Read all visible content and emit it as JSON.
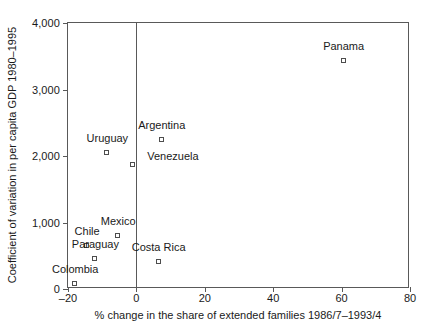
{
  "chart_data": {
    "type": "scatter",
    "title": "",
    "xlabel": "% change in the share of extended families 1986/7–1993/4",
    "ylabel": "Coefficient of variation in per capita GDP 1980–1995",
    "xlim": [
      -20,
      80
    ],
    "ylim": [
      0,
      4000
    ],
    "xticks": [
      -20,
      0,
      20,
      40,
      60,
      80
    ],
    "xtick_labels": [
      "–20",
      "0",
      "20",
      "40",
      "60",
      "80"
    ],
    "yticks": [
      0,
      1000,
      2000,
      3000,
      4000
    ],
    "ytick_labels": [
      "0",
      "1,000",
      "2,000",
      "3,000",
      "4,000"
    ],
    "grid": false,
    "legend": "none",
    "reference_lines": [
      {
        "name": "zero-vertical-line",
        "orientation": "vertical",
        "x": 0
      }
    ],
    "points": [
      {
        "label": "Panama",
        "x": 60.6,
        "y": 3430,
        "label_dx": 0,
        "label_dy": -9
      },
      {
        "label": "Argentina",
        "x": 7.4,
        "y": 2240,
        "label_dx": 0,
        "label_dy": -9
      },
      {
        "label": "Uruguay",
        "x": -8.5,
        "y": 2050,
        "label_dx": 0,
        "label_dy": -9
      },
      {
        "label": "Venezuela",
        "x": -1.0,
        "y": 1860,
        "label_dx": 40,
        "label_dy": -3
      },
      {
        "label": "Mexico",
        "x": -5.3,
        "y": 800,
        "label_dx": 0,
        "label_dy": -9
      },
      {
        "label": "Chile",
        "x": -14.4,
        "y": 650,
        "label_dx": 0,
        "label_dy": -9
      },
      {
        "label": "Paraguay",
        "x": -12.0,
        "y": 450,
        "label_dx": 0,
        "label_dy": -9
      },
      {
        "label": "Costa Rica",
        "x": 6.5,
        "y": 405,
        "label_dx": 0,
        "label_dy": -9
      },
      {
        "label": "Colombia",
        "x": -17.9,
        "y": 75,
        "label_dx": 0,
        "label_dy": -9
      }
    ]
  }
}
